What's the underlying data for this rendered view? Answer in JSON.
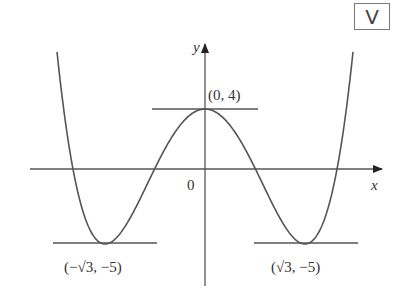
{
  "badge": {
    "icon": "v-logo-icon",
    "label": "V"
  },
  "chart_data": {
    "type": "line",
    "title": "",
    "function": "y = x^4 - 6x^2 + 4",
    "xlabel": "x",
    "ylabel": "y",
    "origin_label": "0",
    "x": [
      -2.6,
      -2.4,
      -2.2,
      -2.0,
      -1.732,
      -1.5,
      -1.2,
      -1.0,
      -0.8,
      -0.5,
      0,
      0.5,
      0.8,
      1.0,
      1.2,
      1.5,
      1.732,
      2.0,
      2.2,
      2.4,
      2.6
    ],
    "y": [
      15.14,
      11.62,
      8.38,
      4.0,
      -5.0,
      -4.44,
      -2.57,
      -1.0,
      0.57,
      2.56,
      4.0,
      2.56,
      0.57,
      -1.0,
      -2.57,
      -4.44,
      -5.0,
      -4.0,
      8.38,
      11.62,
      15.14
    ],
    "annotations": [
      {
        "label": "(0, 4)",
        "x": 0,
        "y": 4,
        "tangent": "horizontal"
      },
      {
        "label": "(−√3, −5)",
        "x": -1.732,
        "y": -5,
        "tangent": "horizontal"
      },
      {
        "label": "(√3, −5)",
        "x": 1.732,
        "y": -5,
        "tangent": "horizontal"
      }
    ],
    "grid": false,
    "legend": null,
    "xlim": [
      -3,
      3
    ],
    "ylim": [
      -7.5,
      8.5
    ]
  },
  "labels": {
    "y_axis": "y",
    "x_axis": "x",
    "origin": "0",
    "max_point": "(0, 4)",
    "left_min": "(−√3, −5)",
    "right_min": "(√3, −5)"
  }
}
